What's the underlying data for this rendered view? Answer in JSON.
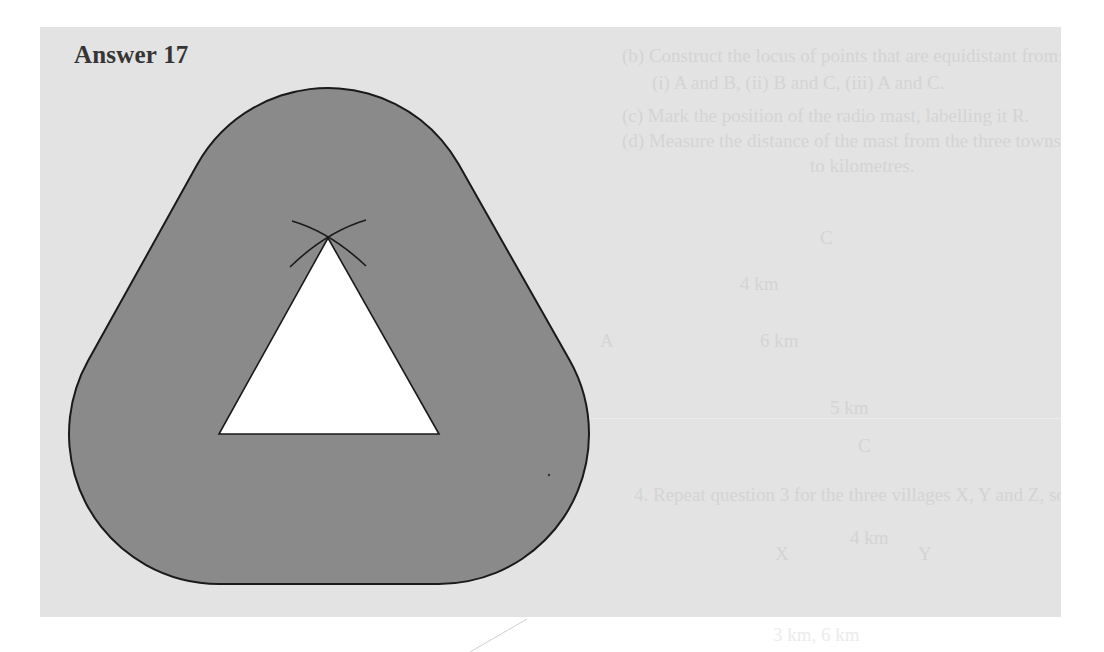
{
  "document": {
    "heading": "Answer 17",
    "colors": {
      "panel_background": "#e3e3e3",
      "region_fill": "#8a8a8a",
      "triangle_fill": "#ffffff",
      "outline": "#1a1a1a",
      "heading_text": "#353535",
      "bleed_text": "#d4d4d4"
    },
    "figure": {
      "description": "Locus of points within a fixed distance of a triangle (shaded rounded region) with construction arcs at the apex",
      "triangle_vertices": [
        [
          328,
          238
        ],
        [
          219,
          434
        ],
        [
          439,
          434
        ]
      ],
      "offset_radius_px": 150
    },
    "bleed_through_text": {
      "lines": [
        "(b) Construct the locus of points that are equidistant from:",
        "(i) A and B,          (ii) B and C,          (iii) A and C.",
        "(c) Mark the position of the radio mast, labelling it R.",
        "(d) Measure the distance of the mast from the three towns and give your answer",
        "to kilometres.",
        "C",
        "4 km",
        "A",
        "6 km",
        "5 km",
        "C",
        "4. Repeat question 3 for the three villages X, Y and Z, so that:",
        "4 km",
        "X",
        "Y",
        "3 km,      6 km"
      ]
    }
  }
}
